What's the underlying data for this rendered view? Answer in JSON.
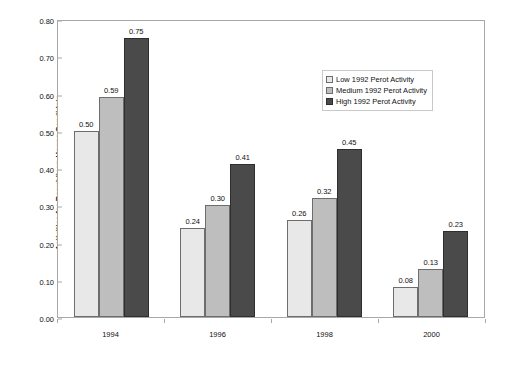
{
  "chart_data": {
    "type": "bar",
    "title": "",
    "xlabel": "",
    "ylabel": "Activities for Republican House Candidate",
    "categories": [
      "1994",
      "1996",
      "1998",
      "2000"
    ],
    "series": [
      {
        "name": "Low 1992 Perot Activity",
        "key": "low",
        "color": "#E8E8E8",
        "values": [
          0.5,
          0.24,
          0.26,
          0.08
        ],
        "labels": [
          "0.50",
          "0.24",
          "0.26",
          "0.08"
        ]
      },
      {
        "name": "Medium 1992 Perot Activity",
        "key": "medium",
        "color": "#BEBEBE",
        "values": [
          0.59,
          0.3,
          0.32,
          0.13
        ],
        "labels": [
          "0.59",
          "0.30",
          "0.32",
          "0.13"
        ]
      },
      {
        "name": "High 1992 Perot Activity",
        "key": "high",
        "color": "#4A4A4A",
        "values": [
          0.75,
          0.41,
          0.45,
          0.23
        ],
        "labels": [
          "0.75",
          "0.41",
          "0.45",
          "0.23"
        ]
      }
    ],
    "ylim": [
      0.0,
      0.8
    ],
    "ytick_step": 0.1,
    "ytick_labels": [
      "0.80",
      "0.70",
      "0.60",
      "0.50",
      "0.40",
      "0.30",
      "0.20",
      "0.10",
      "0.00"
    ],
    "ytick_values": [
      0.8,
      0.7,
      0.6,
      0.5,
      0.4,
      0.3,
      0.2,
      0.1,
      0.0
    ],
    "grid": false,
    "legend_position": "top-right",
    "data_labels_shown": true
  },
  "axes": {
    "y_title": "Activities for Republican House Candidate"
  },
  "legend": {
    "entries": [
      {
        "label": "Low 1992 Perot Activity",
        "swatch": "low"
      },
      {
        "label": "Medium 1992 Perot Activity",
        "swatch": "medium"
      },
      {
        "label": "High 1992 Perot Activity",
        "swatch": "high"
      }
    ]
  }
}
